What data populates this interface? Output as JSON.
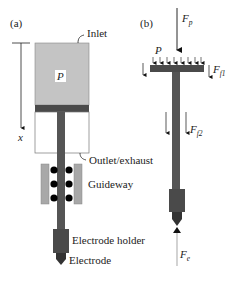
{
  "panel_a": {
    "label": "(a)",
    "axis_label": "x",
    "chamber_pressure_label": "P",
    "callouts": {
      "inlet": "Inlet",
      "outlet": "Outlet/exhaust",
      "guideway": "Guideway",
      "electrode_holder": "Electrode holder",
      "electrode": "Electrode"
    }
  },
  "panel_b": {
    "label": "(b)",
    "pressure_label": "P",
    "forces": {
      "piston_force": {
        "symbol": "F",
        "subscript": "p"
      },
      "friction_1": {
        "symbol": "F",
        "subscript": "f1"
      },
      "friction_2": {
        "symbol": "F",
        "subscript": "f2"
      },
      "electrode_force": {
        "symbol": "F",
        "subscript": "e"
      }
    }
  },
  "colors": {
    "chamber_fill": "#c4c4c4",
    "piston_dark": "#4a4a4a",
    "guideway_fill": "#a8a8a8",
    "ball": "#000000",
    "electrode_force_arrow": "#b5b5b5",
    "line": "#222222"
  }
}
